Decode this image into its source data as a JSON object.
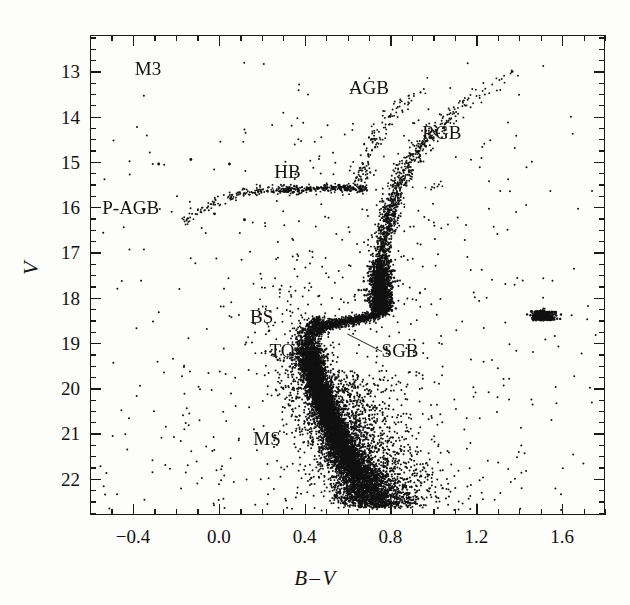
{
  "figure": {
    "cluster_name": "M3",
    "background_color": "#fdfdfc",
    "ink_color": "#15110f"
  },
  "axes": {
    "x": {
      "label_left": "B",
      "label_operator": "–",
      "label_right": "V",
      "label_full": "B – V",
      "major_ticks": [
        "-0.4",
        "0.0",
        "0.4",
        "0.8",
        "1.2",
        "1.6"
      ],
      "major_tick_values": [
        -0.4,
        0.0,
        0.4,
        0.8,
        1.2,
        1.6
      ],
      "minor_tick_step": 0.1,
      "range": [
        -0.6,
        1.8
      ]
    },
    "y": {
      "label": "V",
      "major_ticks": [
        "13",
        "14",
        "15",
        "16",
        "17",
        "18",
        "19",
        "20",
        "21",
        "22"
      ],
      "major_tick_values": [
        13,
        14,
        15,
        16,
        17,
        18,
        19,
        20,
        21,
        22
      ],
      "minor_tick_step": 0.25,
      "range": [
        12.2,
        22.8
      ],
      "inverted": true
    }
  },
  "annotations": [
    {
      "name": "annotation-agb",
      "text": "AGB",
      "bv": 0.7,
      "v": 13.35,
      "align": "center"
    },
    {
      "name": "annotation-rgb",
      "text": "RGB",
      "bv": 1.04,
      "v": 14.35,
      "align": "center"
    },
    {
      "name": "annotation-hb",
      "text": "HB",
      "bv": 0.32,
      "v": 15.2,
      "align": "center"
    },
    {
      "name": "annotation-pagb",
      "text": "P-AGB",
      "bv": -0.41,
      "v": 16.0,
      "align": "center"
    },
    {
      "name": "annotation-bs",
      "text": "BS",
      "bv": 0.2,
      "v": 18.4,
      "align": "center"
    },
    {
      "name": "annotation-to",
      "text": "TO",
      "bv": 0.295,
      "v": 19.15,
      "align": "center"
    },
    {
      "name": "annotation-sgb",
      "text": "SGB",
      "bv": 0.845,
      "v": 19.15,
      "align": "center"
    },
    {
      "name": "annotation-ms",
      "text": "MS",
      "bv": 0.225,
      "v": 21.1,
      "align": "center"
    }
  ],
  "leaders": [
    {
      "name": "leader-line-to",
      "x1_bv": 0.355,
      "y1_v": 19.15,
      "x2_bv": 0.47,
      "y2_v": 19.15
    },
    {
      "name": "leader-line-sgb",
      "x1_bv": 0.76,
      "y1_v": 19.17,
      "x2_bv": 0.6,
      "y2_v": 18.78
    }
  ],
  "chart_data": {
    "type": "scatter",
    "title": "M3",
    "xlabel": "B – V",
    "ylabel": "V",
    "xlim": [
      -0.6,
      1.8
    ],
    "ylim": [
      22.8,
      12.2
    ],
    "y_inverted": true,
    "grid": false,
    "legend": "none",
    "point_color": "#111111",
    "point_size_px": 1.9,
    "n_points_approx": 9400,
    "features": [
      {
        "name": "MS",
        "full_name": "Main Sequence",
        "n_points": 4200,
        "bv_range": [
          0.38,
          0.78
        ],
        "v_range": [
          19.3,
          22.6
        ],
        "ridge": [
          {
            "v": 19.3,
            "bv": 0.425
          },
          {
            "v": 19.7,
            "bv": 0.445
          },
          {
            "v": 20.1,
            "bv": 0.47
          },
          {
            "v": 20.5,
            "bv": 0.5
          },
          {
            "v": 20.9,
            "bv": 0.535
          },
          {
            "v": 21.3,
            "bv": 0.575
          },
          {
            "v": 21.7,
            "bv": 0.62
          },
          {
            "v": 22.1,
            "bv": 0.665
          },
          {
            "v": 22.5,
            "bv": 0.71
          }
        ]
      },
      {
        "name": "TO",
        "full_name": "Main Sequence Turnoff",
        "n_points": 900,
        "bv_range": [
          0.4,
          0.52
        ],
        "v_range": [
          18.5,
          19.5
        ],
        "ridge": [
          {
            "v": 18.55,
            "bv": 0.455
          },
          {
            "v": 18.75,
            "bv": 0.428
          },
          {
            "v": 18.95,
            "bv": 0.415
          },
          {
            "v": 19.15,
            "bv": 0.418
          },
          {
            "v": 19.4,
            "bv": 0.43
          }
        ]
      },
      {
        "name": "SGB",
        "full_name": "Subgiant Branch",
        "n_points": 800,
        "bv_range": [
          0.45,
          0.78
        ],
        "v_range": [
          18.2,
          18.9
        ],
        "ridge": [
          {
            "bv": 0.47,
            "v": 18.7
          },
          {
            "bv": 0.53,
            "v": 18.58
          },
          {
            "bv": 0.59,
            "v": 18.52
          },
          {
            "bv": 0.65,
            "v": 18.48
          },
          {
            "bv": 0.71,
            "v": 18.42
          },
          {
            "bv": 0.76,
            "v": 18.3
          }
        ]
      },
      {
        "name": "RGB",
        "full_name": "Red Giant Branch",
        "n_points": 1500,
        "bv_range": [
          0.55,
          1.55
        ],
        "v_range": [
          12.6,
          18.4
        ],
        "ridge": [
          {
            "v": 18.3,
            "bv": 0.755
          },
          {
            "v": 17.8,
            "bv": 0.752
          },
          {
            "v": 17.3,
            "bv": 0.757
          },
          {
            "v": 16.8,
            "bv": 0.768
          },
          {
            "v": 16.3,
            "bv": 0.787
          },
          {
            "v": 15.8,
            "bv": 0.815
          },
          {
            "v": 15.3,
            "bv": 0.856
          },
          {
            "v": 14.8,
            "bv": 0.92
          },
          {
            "v": 14.3,
            "bv": 1.01
          },
          {
            "v": 13.8,
            "bv": 1.125
          },
          {
            "v": 13.4,
            "bv": 1.25
          },
          {
            "v": 13.0,
            "bv": 1.39
          },
          {
            "v": 12.7,
            "bv": 1.51
          }
        ]
      },
      {
        "name": "HB",
        "full_name": "Horizontal Branch",
        "n_points": 260,
        "bv_range": [
          -0.18,
          0.72
        ],
        "v_range": [
          15.35,
          16.35
        ],
        "ridge": [
          {
            "bv": -0.16,
            "v": 16.32
          },
          {
            "bv": -0.06,
            "v": 16.02
          },
          {
            "bv": 0.02,
            "v": 15.82
          },
          {
            "bv": 0.1,
            "v": 15.7
          },
          {
            "bv": 0.2,
            "v": 15.64
          },
          {
            "bv": 0.32,
            "v": 15.62
          },
          {
            "bv": 0.44,
            "v": 15.6
          },
          {
            "bv": 0.56,
            "v": 15.58
          },
          {
            "bv": 0.66,
            "v": 15.6
          }
        ]
      },
      {
        "name": "AGB",
        "full_name": "Asymptotic Giant Branch",
        "n_points": 150,
        "bv_range": [
          0.6,
          1.1
        ],
        "v_range": [
          13.1,
          15.6
        ],
        "ridge": [
          {
            "v": 15.5,
            "bv": 0.65
          },
          {
            "v": 15.1,
            "bv": 0.672
          },
          {
            "v": 14.7,
            "bv": 0.705
          },
          {
            "v": 14.3,
            "bv": 0.75
          },
          {
            "v": 13.9,
            "bv": 0.815
          },
          {
            "v": 13.5,
            "bv": 0.905
          },
          {
            "v": 13.2,
            "bv": 1.0
          }
        ]
      },
      {
        "name": "P-AGB",
        "full_name": "Post-Asymptotic Giant Branch",
        "n_points": 6,
        "bv_range": [
          -0.3,
          0.1
        ],
        "v_range": [
          14.8,
          16.2
        ]
      },
      {
        "name": "BS",
        "full_name": "Blue Stragglers",
        "n_points": 70,
        "bv_range": [
          0.15,
          0.42
        ],
        "v_range": [
          17.5,
          19.4
        ]
      },
      {
        "name": "field",
        "full_name": "Field / scattered stars",
        "n_points": 1500,
        "bv_range": [
          -0.55,
          1.75
        ],
        "v_range": [
          12.4,
          22.7
        ]
      }
    ]
  }
}
